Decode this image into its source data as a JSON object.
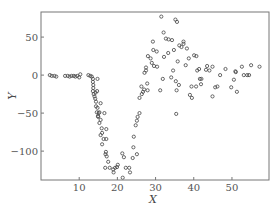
{
  "chart_data": {
    "type": "scatter",
    "title": "",
    "xlabel": "X",
    "ylabel": "Y",
    "xlim": [
      0,
      59.7
    ],
    "ylim": [
      -138,
      83
    ],
    "grid": false,
    "legend": null,
    "xticks": [
      10,
      20,
      30,
      40,
      50
    ],
    "yticks": [
      50,
      0,
      -50,
      -100
    ],
    "xtick_labels": [
      "10",
      "20",
      "30",
      "40",
      "50"
    ],
    "ytick_labels": [
      "50",
      "0",
      "−50",
      "−100"
    ],
    "series": [
      {
        "name": "data",
        "marker": "open-circle",
        "points": [
          [
            2.3,
            0
          ],
          [
            2.8,
            -1
          ],
          [
            3.5,
            -1
          ],
          [
            4.0,
            -2
          ],
          [
            6.3,
            -1
          ],
          [
            7.0,
            -1
          ],
          [
            7.5,
            -2
          ],
          [
            8.0,
            -1
          ],
          [
            8.6,
            -1
          ],
          [
            9.0,
            -2
          ],
          [
            9.5,
            -1
          ],
          [
            10.0,
            -3
          ],
          [
            10.3,
            1
          ],
          [
            12.4,
            0
          ],
          [
            12.9,
            -1
          ],
          [
            13.3,
            -2
          ],
          [
            13.6,
            -5
          ],
          [
            13.6,
            -9
          ],
          [
            13.7,
            -13
          ],
          [
            13.7,
            -17
          ],
          [
            13.6,
            -21
          ],
          [
            13.8,
            -25
          ],
          [
            14.0,
            -28
          ],
          [
            14.8,
            -5
          ],
          [
            14.3,
            -23
          ],
          [
            14.7,
            -21
          ],
          [
            14.2,
            -31
          ],
          [
            14.4,
            -35
          ],
          [
            15.6,
            -37
          ],
          [
            14.4,
            -41
          ],
          [
            14.8,
            -43
          ],
          [
            14.6,
            -49
          ],
          [
            15.1,
            -50
          ],
          [
            15.3,
            -49
          ],
          [
            14.9,
            -54
          ],
          [
            15.0,
            -55
          ],
          [
            15.6,
            -59
          ],
          [
            15.3,
            -63
          ],
          [
            16.6,
            -50
          ],
          [
            15.9,
            -70
          ],
          [
            16.0,
            -76
          ],
          [
            15.6,
            -79
          ],
          [
            16.4,
            -84
          ],
          [
            16.0,
            -91
          ],
          [
            17.1,
            -71
          ],
          [
            17.1,
            -84
          ],
          [
            17.0,
            -101
          ],
          [
            16.9,
            -104
          ],
          [
            17.2,
            -107
          ],
          [
            17.6,
            -114
          ],
          [
            18.0,
            -122
          ],
          [
            16.8,
            -122
          ],
          [
            18.9,
            -124
          ],
          [
            19.4,
            -122
          ],
          [
            19.0,
            -128
          ],
          [
            19.9,
            -121
          ],
          [
            20.1,
            -118
          ],
          [
            21.3,
            -103
          ],
          [
            21.7,
            -108
          ],
          [
            21.4,
            -135
          ],
          [
            22.2,
            -122
          ],
          [
            23.1,
            -122
          ],
          [
            23.3,
            -128
          ],
          [
            24.0,
            -109
          ],
          [
            24.2,
            -95
          ],
          [
            24.3,
            -81
          ],
          [
            25.1,
            -104
          ],
          [
            24.8,
            -66
          ],
          [
            25.1,
            -60
          ],
          [
            25.3,
            -55
          ],
          [
            25.8,
            -50
          ],
          [
            25.8,
            -30
          ],
          [
            26.4,
            -25
          ],
          [
            26.3,
            -15
          ],
          [
            26.7,
            -22
          ],
          [
            27.0,
            -19
          ],
          [
            27.9,
            -20
          ],
          [
            27.8,
            -11
          ],
          [
            27.1,
            3
          ],
          [
            27.5,
            6
          ],
          [
            27.5,
            10
          ],
          [
            28.0,
            25
          ],
          [
            28.7,
            22
          ],
          [
            29.0,
            16
          ],
          [
            29.6,
            12
          ],
          [
            30.4,
            11
          ],
          [
            31.2,
            -20
          ],
          [
            31.9,
            -5
          ],
          [
            32.2,
            24
          ],
          [
            29.3,
            44
          ],
          [
            29.4,
            33
          ],
          [
            30.3,
            31
          ],
          [
            31.5,
            77
          ],
          [
            32.1,
            56
          ],
          [
            32.7,
            48
          ],
          [
            33.4,
            47
          ],
          [
            34.3,
            46
          ],
          [
            35.2,
            73
          ],
          [
            35.6,
            70
          ],
          [
            36.2,
            39
          ],
          [
            36.8,
            37
          ],
          [
            37.3,
            41
          ],
          [
            37.9,
            13
          ],
          [
            38.2,
            35
          ],
          [
            38.7,
            22
          ],
          [
            34.8,
            33
          ],
          [
            33.3,
            29
          ],
          [
            35.8,
            18
          ],
          [
            34.6,
            6
          ],
          [
            35.3,
            -8
          ],
          [
            34.1,
            -3
          ],
          [
            36.1,
            -13
          ],
          [
            35.5,
            -20
          ],
          [
            35.4,
            -51
          ],
          [
            37.3,
            44
          ],
          [
            40.1,
            26
          ],
          [
            40.7,
            25
          ],
          [
            39.4,
            -15
          ],
          [
            40.6,
            -15
          ],
          [
            41.9,
            -12
          ],
          [
            39.0,
            -26
          ],
          [
            39.5,
            -30
          ],
          [
            40.9,
            6
          ],
          [
            41.4,
            8
          ],
          [
            41.6,
            -5
          ],
          [
            42.0,
            -5
          ],
          [
            43.2,
            7
          ],
          [
            43.5,
            12
          ],
          [
            44.1,
            6
          ],
          [
            44.9,
            11
          ],
          [
            45.6,
            -16
          ],
          [
            46.2,
            -15
          ],
          [
            46.9,
            0
          ],
          [
            48.3,
            8
          ],
          [
            49.8,
            -16
          ],
          [
            50.9,
            5
          ],
          [
            50.5,
            -6
          ],
          [
            51.0,
            4
          ],
          [
            52.6,
            11
          ],
          [
            53.1,
            0
          ],
          [
            54.0,
            0
          ],
          [
            54.5,
            0
          ],
          [
            57.2,
            11
          ],
          [
            51.3,
            -22
          ],
          [
            55.0,
            13
          ],
          [
            44.9,
            -28
          ]
        ]
      }
    ],
    "plot_area_px": {
      "left": 41,
      "top": 12,
      "right": 269,
      "bottom": 180
    }
  }
}
